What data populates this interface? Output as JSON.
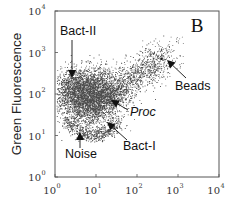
{
  "chart_data": {
    "type": "scatter",
    "title": "",
    "panel_label": "B",
    "xlabel": "",
    "ylabel": "Green Fluorescence",
    "xscale": "log",
    "yscale": "log",
    "xlim": [
      1,
      10000
    ],
    "ylim": [
      1,
      10000
    ],
    "grid": false,
    "legend": null,
    "x_ticks": [
      {
        "base": "10",
        "exp": "0"
      },
      {
        "base": "10",
        "exp": "1"
      },
      {
        "base": "10",
        "exp": "2"
      },
      {
        "base": "10",
        "exp": "3"
      },
      {
        "base": "10",
        "exp": "4"
      }
    ],
    "y_ticks": [
      {
        "base": "10",
        "exp": "0"
      },
      {
        "base": "10",
        "exp": "1"
      },
      {
        "base": "10",
        "exp": "2"
      },
      {
        "base": "10",
        "exp": "3"
      },
      {
        "base": "10",
        "exp": "4"
      }
    ],
    "populations": [
      {
        "name": "Bact-II",
        "center_log": [
          0.55,
          2.15
        ],
        "spread_log": [
          0.35,
          0.25
        ],
        "density": "high"
      },
      {
        "name": "Bact-I",
        "center_log": [
          0.95,
          1.85
        ],
        "spread_log": [
          0.35,
          0.3
        ],
        "density": "very high"
      },
      {
        "name": "Proc",
        "center_log": [
          1.3,
          2.0
        ],
        "spread_log": [
          0.5,
          0.35
        ],
        "density": "medium"
      },
      {
        "name": "Noise",
        "center_log": [
          0.6,
          1.15
        ],
        "spread_log": [
          0.4,
          0.15
        ],
        "density": "low"
      },
      {
        "name": "Beads",
        "center_log": [
          2.6,
          2.85
        ],
        "spread_log": [
          0.0,
          0.0
        ],
        "density": "single point"
      }
    ],
    "annotations": [
      {
        "label": "Bact-II",
        "text_pos_log": [
          0.55,
          2.9
        ],
        "arrow_to_log": [
          0.55,
          2.35
        ],
        "italic": false
      },
      {
        "label": "Proc",
        "text_pos_log": [
          1.95,
          1.65
        ],
        "arrow_to_log": [
          1.55,
          1.95
        ],
        "italic": true
      },
      {
        "label": "Beads",
        "text_pos_log": [
          2.9,
          2.2
        ],
        "arrow_to_log": [
          2.7,
          2.75
        ],
        "italic": false
      },
      {
        "label": "Bact-I",
        "text_pos_log": [
          1.55,
          1.05
        ],
        "arrow_to_log": [
          1.2,
          1.55
        ],
        "italic": false
      },
      {
        "label": "Noise",
        "text_pos_log": [
          0.35,
          0.6
        ],
        "arrow_to_log": [
          0.55,
          1.0
        ],
        "italic": false
      }
    ]
  },
  "colors": {
    "points": "#111111",
    "axis": "#555555",
    "text": "#111111"
  }
}
